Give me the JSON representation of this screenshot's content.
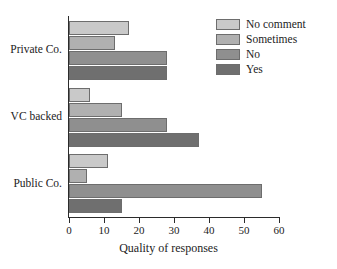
{
  "chart_data": {
    "type": "bar",
    "orientation": "horizontal",
    "title": "",
    "subtitle": "",
    "xlabel": "Quality of responses",
    "ylabel": "",
    "categories": [
      "Private Co.",
      "VC backed",
      "Public Co."
    ],
    "series": [
      {
        "name": "No comment",
        "color": "#c9c9c9",
        "values": [
          17,
          6,
          11
        ]
      },
      {
        "name": "Sometimes",
        "color": "#b0b0b0",
        "values": [
          13,
          15,
          5
        ]
      },
      {
        "name": "No",
        "color": "#8f8f8f",
        "values": [
          28,
          28,
          55
        ]
      },
      {
        "name": "Yes",
        "color": "#6f6f6f",
        "values": [
          28,
          37,
          15
        ]
      }
    ],
    "xlim": [
      0,
      60
    ],
    "xticks": [
      0,
      10,
      20,
      30,
      40,
      50,
      60
    ],
    "xtick_labels": [
      "0",
      "10",
      "20",
      "30",
      "40",
      "50",
      "60"
    ],
    "grid": false,
    "legend_position": "top-right",
    "legend_entries": [
      "No comment",
      "Sometimes",
      "No",
      "Yes"
    ],
    "bar_edge_color": "#6d6d6d",
    "axis_color": "#2b2b2b",
    "background_color": "#ffffff"
  }
}
